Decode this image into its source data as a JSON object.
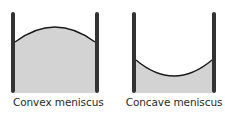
{
  "diagram": {
    "panels": [
      {
        "id": "convex",
        "label": "Convex meniscus",
        "meniscus_shape": "convex"
      },
      {
        "id": "concave",
        "label": "Concave meniscus",
        "meniscus_shape": "concave"
      }
    ],
    "colors": {
      "liquid": "#d3d3d3",
      "wall": "#333333",
      "wall_highlight": "#9a9a9a",
      "curve": "#1a1a1a",
      "background": "#ffffff"
    }
  }
}
